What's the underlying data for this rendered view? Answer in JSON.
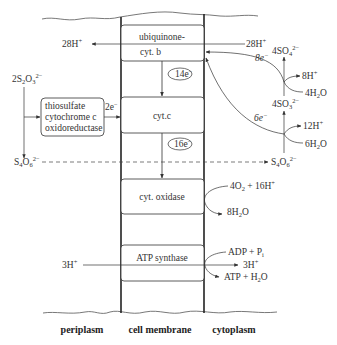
{
  "diagram": {
    "title": "",
    "compartments": {
      "left": "periplasm",
      "middle": "cell membrane",
      "right": "cytoplasm"
    },
    "membrane_complexes": [
      {
        "id": "ubq",
        "line1": "ubiquinone-",
        "line2": "cyt. b"
      },
      {
        "id": "cytc",
        "label": "cyt.c"
      },
      {
        "id": "cox",
        "label": "cyt. oxidase"
      },
      {
        "id": "atp",
        "label": "ATP synthase"
      }
    ],
    "periplasm_enzyme": {
      "line1": "thiosulfate",
      "line2": "cytochrome  c",
      "line3": "oxidoreductase"
    },
    "electron_labels": {
      "to_membrane": "2e",
      "ubq_to_cytc": "14e",
      "cytc_to_cox": "16e",
      "sulfate_branch": "8e",
      "sulfite_branch": "6e"
    },
    "species": {
      "thiosulfate": {
        "coef": "2S",
        "sub1": "2",
        "mid": "O",
        "sub2": "3",
        "charge": "2−"
      },
      "tetrathionate_left": {
        "base": "S",
        "sub1": "4",
        "mid": "O",
        "sub2": "6",
        "charge": "2−"
      },
      "tetrathionate_right": {
        "base": "S",
        "sub1": "4",
        "mid": "O",
        "sub2": "6",
        "charge": "2−"
      },
      "protons_out_left": {
        "text": "28H",
        "charge": "+"
      },
      "protons_in_right": {
        "text": "28H",
        "charge": "+"
      },
      "sulfate": {
        "text": "4SO",
        "sub": "4",
        "charge": "2−"
      },
      "sulfite": {
        "text": "4SO",
        "sub": "3",
        "charge": "2−"
      },
      "h8": {
        "text": "8H",
        "charge": "+"
      },
      "water4": {
        "pre": "4H",
        "sub": "2",
        "post": "O"
      },
      "h12": {
        "text": "12H",
        "charge": "+"
      },
      "water6": {
        "pre": "6H",
        "sub": "2",
        "post": "O"
      },
      "oxygen": {
        "pre": "4O",
        "sub": "2",
        "post": " + 16H",
        "charge": "+"
      },
      "water8": {
        "pre": "8H",
        "sub": "2",
        "post": "O"
      },
      "h3_left": {
        "text": "3H",
        "charge": "+"
      },
      "adp": {
        "pre": "ADP + P",
        "sub": "i"
      },
      "h3_right": {
        "text": "3H",
        "charge": "+"
      },
      "atp": {
        "pre": "ATP + H",
        "sub": "2",
        "post": "O"
      }
    },
    "colors": {
      "line": "#333333",
      "background": "#ffffff"
    }
  }
}
